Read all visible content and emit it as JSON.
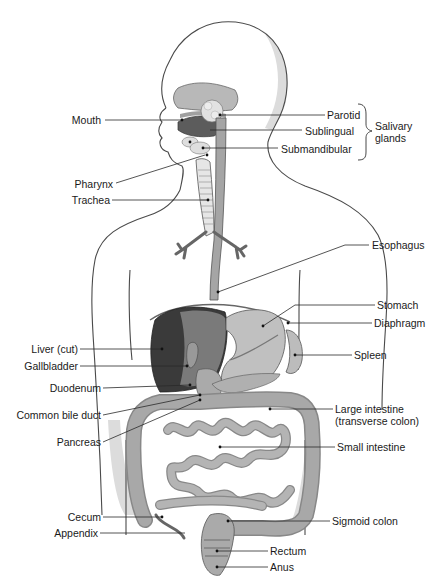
{
  "diagram": {
    "labels_left": [
      {
        "id": "mouth",
        "text": "Mouth"
      },
      {
        "id": "pharynx",
        "text": "Pharynx"
      },
      {
        "id": "trachea",
        "text": "Trachea"
      },
      {
        "id": "liver",
        "text": "Liver (cut)"
      },
      {
        "id": "gallbladder",
        "text": "Gallbladder"
      },
      {
        "id": "duodenum",
        "text": "Duodenum"
      },
      {
        "id": "bile_duct",
        "text": "Common bile duct"
      },
      {
        "id": "pancreas",
        "text": "Pancreas"
      },
      {
        "id": "cecum",
        "text": "Cecum"
      },
      {
        "id": "appendix",
        "text": "Appendix"
      }
    ],
    "labels_right": [
      {
        "id": "parotid",
        "text": "Parotid"
      },
      {
        "id": "sublingual",
        "text": "Sublingual"
      },
      {
        "id": "submandibular",
        "text": "Submandibular"
      },
      {
        "id": "esophagus",
        "text": "Esophagus"
      },
      {
        "id": "stomach",
        "text": "Stomach"
      },
      {
        "id": "diaphragm",
        "text": "Diaphragm"
      },
      {
        "id": "spleen",
        "text": "Spleen"
      },
      {
        "id": "large_intestine",
        "text": "Large intestine"
      },
      {
        "id": "large_intestine_sub",
        "text": "(transverse colon)"
      },
      {
        "id": "small_intestine",
        "text": "Small intestine"
      },
      {
        "id": "sigmoid",
        "text": "Sigmoid colon"
      },
      {
        "id": "rectum",
        "text": "Rectum"
      },
      {
        "id": "anus",
        "text": "Anus"
      }
    ],
    "group_label": {
      "line1": "Salivary",
      "line2": "glands"
    },
    "colors": {
      "organ_light": "#c4c4c4",
      "organ_mid": "#a8a8a8",
      "organ_dark": "#5a5a5a",
      "liver_dark": "#3a3a3a",
      "body_outline": "#4a4a4a",
      "shadow": "#dcdcdc"
    }
  }
}
